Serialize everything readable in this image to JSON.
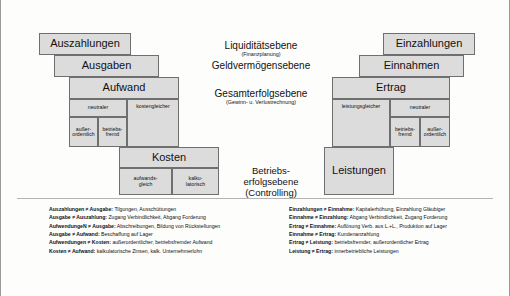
{
  "diagram": {
    "left_stack": [
      {
        "label": "Auszahlungen"
      },
      {
        "label": "Ausgaben"
      },
      {
        "label": "Aufwand"
      },
      {
        "label": "Kosten"
      }
    ],
    "right_stack": [
      {
        "label": "Einzahlungen"
      },
      {
        "label": "Einnahmen"
      },
      {
        "label": "Ertrag"
      },
      {
        "label": "Leistungen"
      }
    ],
    "aufwand_sub": {
      "neutral": "neutraler",
      "kostengleich": "kostengleicher",
      "ausserordentlich": "außer-\nordentlich",
      "betriebsfremd": "betriebs-\nfremd"
    },
    "kosten_sub": {
      "aufwandsgleich": "aufwands-\ngleich",
      "kalkulatorisch": "kalku-\nlatorisch"
    },
    "ertrag_sub": {
      "leistungsgleich": "leistungsgleicher",
      "neutral": "neutraler",
      "betriebsfremd": "betriebs-\nfremd",
      "ausserordentlich": "außer-\nordentlich"
    },
    "levels": [
      {
        "name": "Liquiditätsebene",
        "paren": "(Finanzplanung)"
      },
      {
        "name": "Geldvermögensebene",
        "paren": ""
      },
      {
        "name": "Gesamterfolgsebene",
        "paren": "(Gewinn- u. Verlustrechnung)"
      },
      {
        "name": "Betriebs-\nerfolgsebene",
        "paren": "(Controlling)"
      }
    ]
  },
  "legend": {
    "left": [
      {
        "term": "Auszahlungen ≠ Ausgabe:",
        "desc": "Tilgungen, Ausschüttungen"
      },
      {
        "term": "Ausgabe ≠ Auszahlung:",
        "desc": "Zugang Verbindlichkeit, Abgang Forderung"
      },
      {
        "term": "AufwendungeN ≠ Ausgabe:",
        "desc": "Abschreibungen, Bildung von Rückstellungen"
      },
      {
        "term": "Ausgabe ≠ Aufwand:",
        "desc": "Beschaffung auf Lager"
      },
      {
        "term": "Aufwendungen ≠ Kosten:",
        "desc": "außerordentlicher, betriebsfremder Aufwand"
      },
      {
        "term": "Kosten ≠ Aufwand:",
        "desc": "kalkulatorische Zinsen,  kalk. Unternehmerlohn"
      }
    ],
    "right": [
      {
        "term": "Einzahlungen ≠ Einnahme:",
        "desc": "Kapitalerhöhung, Einzahlung Gläubiger"
      },
      {
        "term": "Einnahme ≠ Einzahlung:",
        "desc": "Abgang Verbindlichkeit, Zugang Forderung"
      },
      {
        "term": "Ertrag ≠ Einnahme:",
        "desc": "Auflösung Verb. aus L.+L., Produktion auf Lager"
      },
      {
        "term": "Einnahme ≠ Ertrag:",
        "desc": "Kundenanzahlung"
      },
      {
        "term": "Ertrag ≠ Leistung:",
        "desc": "betriebsfremder, außerordentlicher Ertrag"
      },
      {
        "term": "Leistung ≠ Ertrag:",
        "desc": "innerbetriebliche Leistungen"
      }
    ]
  }
}
